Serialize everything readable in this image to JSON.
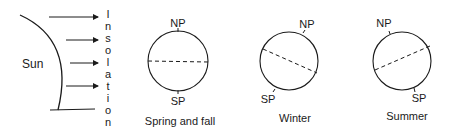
{
  "sun": {
    "label": "Sun"
  },
  "insolation": {
    "letters": [
      "I",
      "n",
      "s",
      "o",
      "l",
      "a",
      "t",
      "i",
      "o",
      "n"
    ]
  },
  "panels": [
    {
      "caption": "Spring and fall",
      "north_label": "NP",
      "south_label": "SP"
    },
    {
      "caption": "Winter",
      "north_label": "NP",
      "south_label": "SP"
    },
    {
      "caption": "Summer",
      "north_label": "NP",
      "south_label": "SP"
    }
  ],
  "colors": {
    "ink": "#1a1a1a",
    "background": "#ffffff"
  }
}
